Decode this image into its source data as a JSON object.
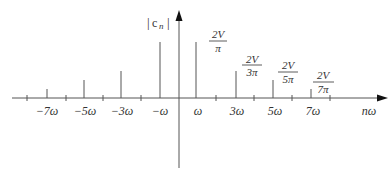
{
  "y_axis_label": "|c_n|",
  "y_axis_label_parts": {
    "bar_left": "|",
    "c": "c",
    "n": "n",
    "bar_right": "|"
  },
  "x_axis_label": "nω",
  "x_tick_labels": [
    "−7ω",
    "−5ω",
    "−3ω",
    "−ω",
    "ω",
    "3ω",
    "5ω",
    "7ω"
  ],
  "amplitude_labels": [
    {
      "num": "2V",
      "den": "π"
    },
    {
      "num": "2V",
      "den": "3π"
    },
    {
      "num": "2V",
      "den": "5π"
    },
    {
      "num": "2V",
      "den": "7π"
    }
  ],
  "colors": {
    "line": "#555555",
    "text": "#333333"
  }
}
